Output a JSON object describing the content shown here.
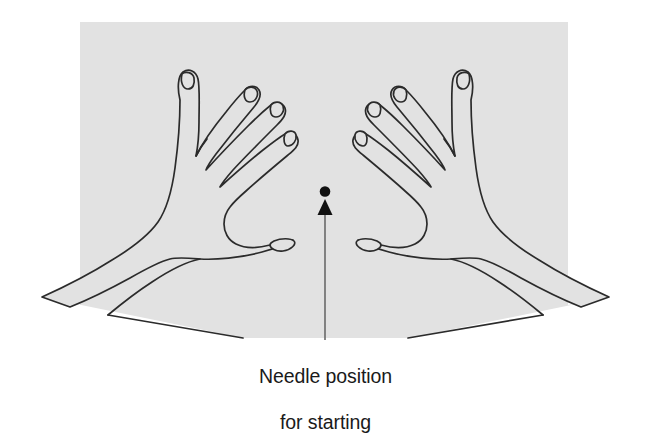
{
  "figure": {
    "type": "line-drawing-illustration",
    "background_panel": {
      "fill": "#e2e2e2",
      "rect": {
        "x": 80,
        "y": 22,
        "width": 488,
        "height": 283
      }
    },
    "canvas": {
      "width": 651,
      "height": 413,
      "background": "#ffffff"
    },
    "stroke_color": "#2b2b2b",
    "hands": [
      {
        "name": "left-hand",
        "side": "left",
        "fingers": 4,
        "thumb": 1,
        "description": "left hand splayed, fingers angled up and to the right, thumb extending right toward the needle point"
      },
      {
        "name": "right-hand",
        "side": "right",
        "fingers": 4,
        "thumb": 1,
        "description": "right hand splayed, mirror of left hand, fingers angled up and to the left, thumb extending left toward the needle point"
      }
    ],
    "needle_marker": {
      "name": "needle-position-marker",
      "dot": {
        "cx": 325,
        "cy": 192,
        "r": 5.2,
        "fill": "#111111"
      },
      "arrowhead": {
        "tip_x": 325,
        "tip_y": 200,
        "base_y": 214,
        "half_width": 7,
        "fill": "#111111"
      },
      "leader_line": {
        "x": 325,
        "y_top": 212,
        "y_bottom": 340,
        "color": "#6a6a6a",
        "width": 1.6
      }
    }
  },
  "caption": {
    "line1": "Needle position",
    "line2": "for starting",
    "color": "#1a1a1a",
    "align": "center"
  }
}
